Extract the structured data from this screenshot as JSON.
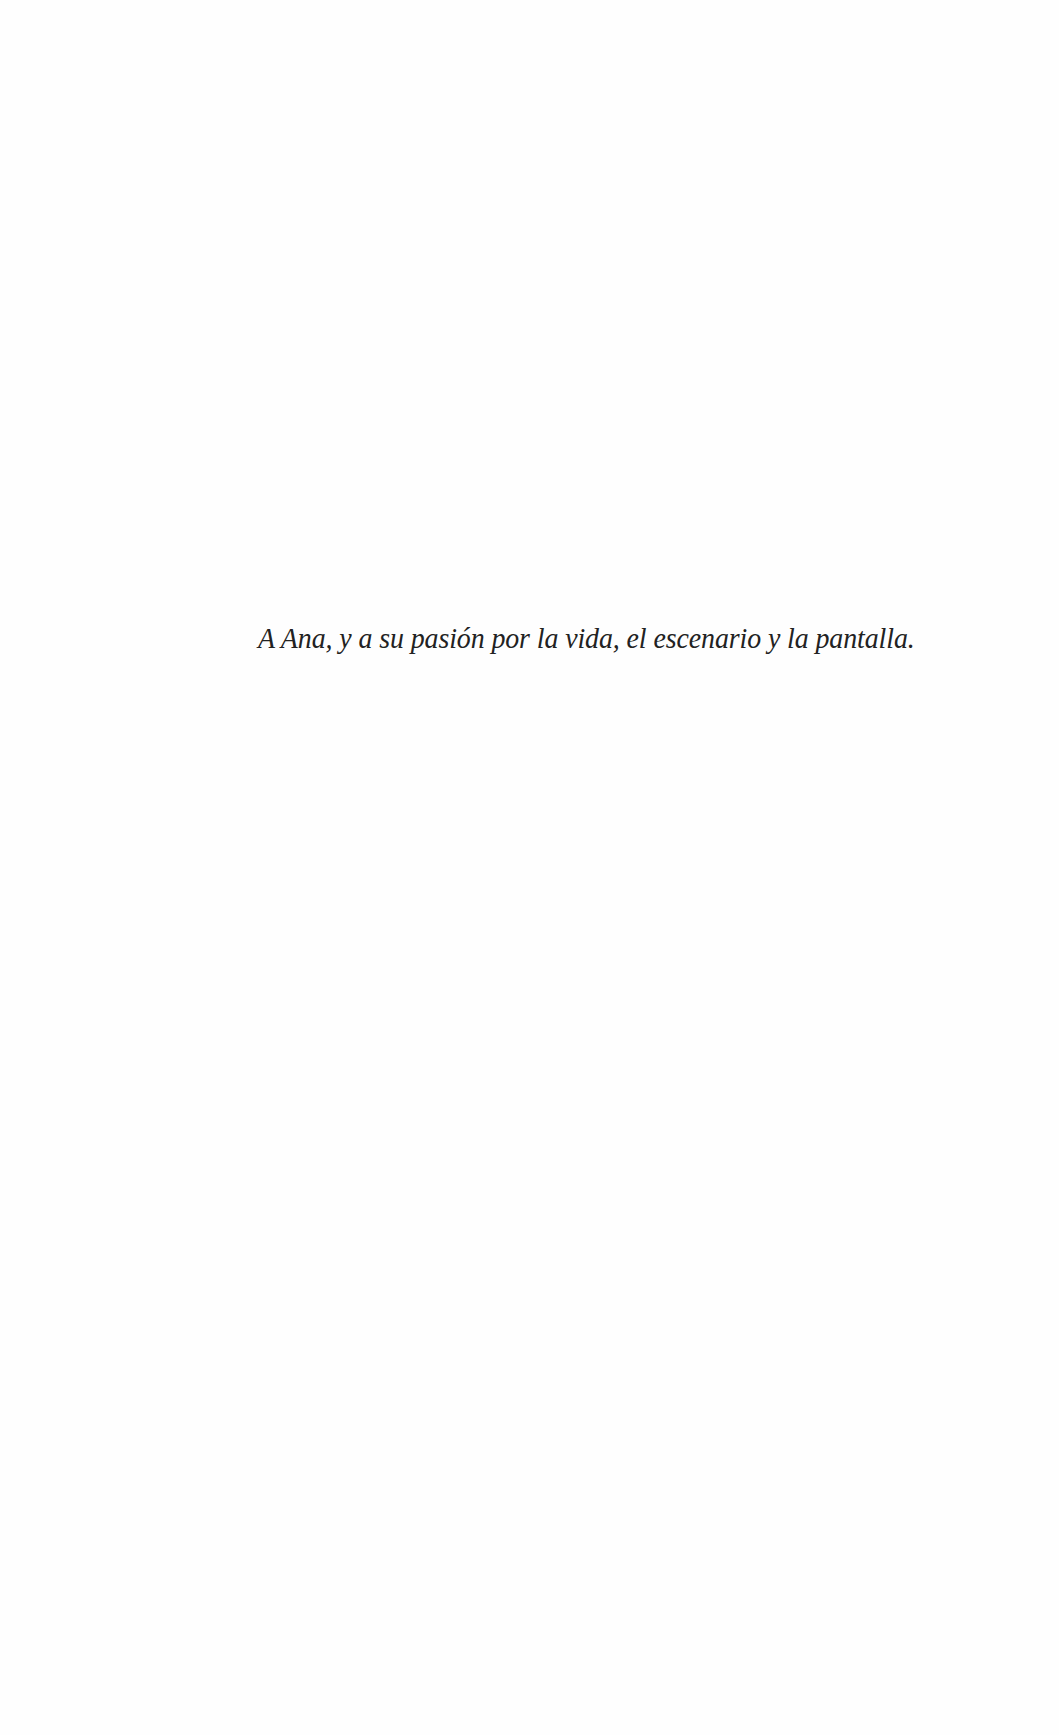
{
  "page": {
    "dedication": "A Ana, y a su pasión por la vida, el escenario y la pantalla."
  },
  "colors": {
    "background": "#fefefe",
    "text": "#222222"
  }
}
